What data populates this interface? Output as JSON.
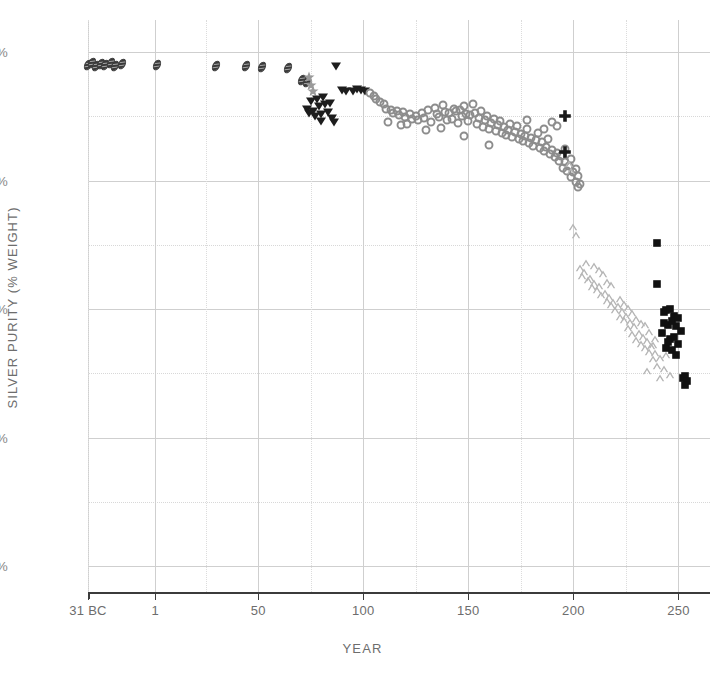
{
  "chart_data": {
    "type": "scatter",
    "title": "",
    "xlabel": "YEAR",
    "ylabel": "SILVER PURITY (% WEIGHT)",
    "xlim": [
      -31,
      265
    ],
    "ylim": [
      0,
      104
    ],
    "grid": true,
    "legend_position": "none",
    "xticks": [
      {
        "value": -31,
        "label": "31 BC"
      },
      {
        "value": 1,
        "label": "1"
      },
      {
        "value": 50,
        "label": "50"
      },
      {
        "value": 100,
        "label": "100"
      },
      {
        "value": 150,
        "label": "150"
      },
      {
        "value": 200,
        "label": "200"
      },
      {
        "value": 250,
        "label": "250"
      }
    ],
    "yticks": [
      {
        "value": 0,
        "label": "0%"
      },
      {
        "value": 25,
        "label": "25%"
      },
      {
        "value": 50,
        "label": "50%"
      },
      {
        "value": 75,
        "label": "75%"
      },
      {
        "value": 100,
        "label": "100%"
      }
    ],
    "y_minor_gridlines": [
      12.5,
      37.5,
      62.5,
      87.5
    ],
    "x_minor_gridlines": [
      -31,
      25,
      75,
      125,
      175,
      225
    ],
    "series": [
      {
        "name": "Republican / Augustan denarius",
        "marker": "hatched-ellipse",
        "color": "#3a3a3a",
        "points": [
          [
            -31,
            97.5
          ],
          [
            -29,
            97.8
          ],
          [
            -27,
            97.2
          ],
          [
            -25,
            97.6
          ],
          [
            -23,
            97.4
          ],
          [
            -20,
            97.9
          ],
          [
            -18,
            97.3
          ],
          [
            -15,
            97.6
          ],
          [
            2,
            97.4
          ],
          [
            30,
            97.3
          ],
          [
            44,
            97.2
          ],
          [
            52,
            97.1
          ],
          [
            64,
            96.8
          ],
          [
            71,
            94.6
          ],
          [
            73,
            94.2
          ]
        ]
      },
      {
        "name": "Tiberius–Nero group",
        "marker": "star",
        "color": "#9a9a9a",
        "points": [
          [
            74,
            95.2
          ],
          [
            75,
            93.6
          ],
          [
            76,
            92.4
          ]
        ]
      },
      {
        "name": "Flavian denarius",
        "marker": "triangle-down",
        "color": "#1d1d1d",
        "points": [
          [
            73,
            89.0
          ],
          [
            74,
            88.2
          ],
          [
            75,
            90.4
          ],
          [
            76,
            88.6
          ],
          [
            77,
            87.6
          ],
          [
            78,
            90.8
          ],
          [
            79,
            89.4
          ],
          [
            80,
            88.0
          ],
          [
            80,
            86.6
          ],
          [
            81,
            91.2
          ],
          [
            82,
            89.8
          ],
          [
            83,
            88.4
          ],
          [
            84,
            90.0
          ],
          [
            85,
            87.2
          ],
          [
            86,
            86.4
          ],
          [
            87,
            97.2
          ],
          [
            90,
            92.6
          ],
          [
            92,
            92.4
          ],
          [
            95,
            92.5
          ],
          [
            97,
            92.8
          ],
          [
            99,
            92.6
          ],
          [
            101,
            92.4
          ]
        ]
      },
      {
        "name": "2nd-century denarius (main series)",
        "marker": "circle-open",
        "color": "#8c8c8c",
        "points": [
          [
            103,
            92.0
          ],
          [
            105,
            91.4
          ],
          [
            106,
            90.8
          ],
          [
            108,
            90.2
          ],
          [
            110,
            89.8
          ],
          [
            111,
            89.0
          ],
          [
            113,
            88.8
          ],
          [
            114,
            88.2
          ],
          [
            116,
            88.6
          ],
          [
            117,
            87.8
          ],
          [
            119,
            88.4
          ],
          [
            120,
            87.4
          ],
          [
            122,
            88.0
          ],
          [
            123,
            87.0
          ],
          [
            125,
            87.6
          ],
          [
            126,
            86.8
          ],
          [
            128,
            88.2
          ],
          [
            129,
            87.2
          ],
          [
            131,
            88.8
          ],
          [
            132,
            86.4
          ],
          [
            134,
            89.2
          ],
          [
            135,
            88.0
          ],
          [
            136,
            87.4
          ],
          [
            138,
            89.6
          ],
          [
            139,
            88.4
          ],
          [
            140,
            86.8
          ],
          [
            141,
            88.2
          ],
          [
            142,
            87.0
          ],
          [
            143,
            89.0
          ],
          [
            144,
            88.6
          ],
          [
            145,
            86.2
          ],
          [
            146,
            88.8
          ],
          [
            147,
            87.6
          ],
          [
            148,
            89.4
          ],
          [
            149,
            88.0
          ],
          [
            150,
            86.6
          ],
          [
            151,
            87.8
          ],
          [
            152,
            89.8
          ],
          [
            153,
            88.2
          ],
          [
            154,
            86.0
          ],
          [
            155,
            87.2
          ],
          [
            156,
            88.6
          ],
          [
            157,
            85.4
          ],
          [
            158,
            86.8
          ],
          [
            159,
            87.6
          ],
          [
            160,
            85.0
          ],
          [
            161,
            86.2
          ],
          [
            162,
            87.0
          ],
          [
            163,
            84.6
          ],
          [
            164,
            85.8
          ],
          [
            165,
            86.6
          ],
          [
            166,
            84.2
          ],
          [
            167,
            85.4
          ],
          [
            168,
            83.8
          ],
          [
            169,
            84.8
          ],
          [
            170,
            86.0
          ],
          [
            171,
            83.4
          ],
          [
            172,
            84.4
          ],
          [
            173,
            85.6
          ],
          [
            174,
            83.0
          ],
          [
            175,
            84.0
          ],
          [
            176,
            82.6
          ],
          [
            177,
            83.6
          ],
          [
            178,
            85.0
          ],
          [
            179,
            82.2
          ],
          [
            180,
            83.2
          ],
          [
            181,
            81.8
          ],
          [
            182,
            82.8
          ],
          [
            183,
            84.2
          ],
          [
            184,
            81.4
          ],
          [
            185,
            82.4
          ],
          [
            186,
            80.8
          ],
          [
            187,
            81.6
          ],
          [
            188,
            83.0
          ],
          [
            189,
            80.2
          ],
          [
            190,
            81.0
          ],
          [
            191,
            79.6
          ],
          [
            192,
            80.4
          ],
          [
            193,
            78.8
          ],
          [
            194,
            79.8
          ],
          [
            195,
            77.4
          ],
          [
            196,
            78.6
          ],
          [
            197,
            76.8
          ],
          [
            198,
            77.8
          ],
          [
            199,
            75.6
          ],
          [
            200,
            76.6
          ],
          [
            201,
            74.8
          ],
          [
            202,
            75.8
          ],
          [
            148,
            83.6
          ],
          [
            160,
            82.0
          ],
          [
            137,
            85.2
          ],
          [
            118,
            85.8
          ],
          [
            130,
            84.8
          ],
          [
            121,
            86.0
          ],
          [
            112,
            86.4
          ],
          [
            192,
            85.6
          ],
          [
            190,
            86.4
          ],
          [
            186,
            85.0
          ],
          [
            178,
            86.8
          ],
          [
            196,
            81.2
          ],
          [
            199,
            79.2
          ],
          [
            201,
            77.2
          ],
          [
            202,
            73.8
          ],
          [
            203,
            74.4
          ]
        ]
      },
      {
        "name": "Septimius Severus high-purity issues",
        "marker": "plus",
        "color": "#1a1a1a",
        "points": [
          [
            196,
            87.6
          ],
          [
            196,
            80.6
          ]
        ]
      },
      {
        "name": "3rd-century antoninianus / debased denarius",
        "marker": "caret",
        "color": "#b5b5b5",
        "points": [
          [
            198,
            78.2
          ],
          [
            199,
            76.8
          ],
          [
            200,
            66.0
          ],
          [
            201,
            64.4
          ],
          [
            203,
            58.0
          ],
          [
            204,
            56.4
          ],
          [
            205,
            57.2
          ],
          [
            207,
            55.6
          ],
          [
            208,
            56.0
          ],
          [
            209,
            54.2
          ],
          [
            210,
            55.0
          ],
          [
            211,
            53.6
          ],
          [
            212,
            54.4
          ],
          [
            213,
            52.8
          ],
          [
            214,
            56.8
          ],
          [
            215,
            53.2
          ],
          [
            216,
            51.6
          ],
          [
            217,
            52.4
          ],
          [
            218,
            50.8
          ],
          [
            219,
            51.4
          ],
          [
            220,
            49.8
          ],
          [
            221,
            50.6
          ],
          [
            222,
            48.4
          ],
          [
            223,
            49.6
          ],
          [
            224,
            47.8
          ],
          [
            225,
            48.6
          ],
          [
            226,
            46.4
          ],
          [
            227,
            47.4
          ],
          [
            228,
            45.2
          ],
          [
            229,
            46.6
          ],
          [
            230,
            44.0
          ],
          [
            231,
            45.4
          ],
          [
            232,
            43.2
          ],
          [
            233,
            44.6
          ],
          [
            234,
            42.4
          ],
          [
            235,
            43.8
          ],
          [
            236,
            41.6
          ],
          [
            237,
            42.8
          ],
          [
            238,
            40.2
          ],
          [
            239,
            41.4
          ],
          [
            240,
            39.0
          ],
          [
            241,
            40.4
          ],
          [
            243,
            38.4
          ],
          [
            246,
            37.2
          ],
          [
            206,
            59.0
          ],
          [
            212,
            57.6
          ],
          [
            218,
            54.6
          ],
          [
            224,
            51.0
          ],
          [
            230,
            48.0
          ],
          [
            236,
            45.6
          ],
          [
            228,
            49.2
          ],
          [
            234,
            46.8
          ],
          [
            239,
            44.2
          ],
          [
            222,
            52.0
          ],
          [
            216,
            55.2
          ],
          [
            210,
            58.4
          ],
          [
            226,
            50.2
          ],
          [
            232,
            47.2
          ],
          [
            238,
            43.0
          ],
          [
            244,
            41.0
          ],
          [
            241,
            36.6
          ],
          [
            235,
            38.0
          ]
        ]
      },
      {
        "name": "Mid-3rd-century antoninianus",
        "marker": "square-filled",
        "color": "#111111",
        "points": [
          [
            240,
            62.8
          ],
          [
            240,
            54.8
          ],
          [
            243,
            49.4
          ],
          [
            244,
            49.8
          ],
          [
            246,
            50.0
          ],
          [
            243,
            47.2
          ],
          [
            245,
            46.8
          ],
          [
            248,
            48.6
          ],
          [
            242,
            45.4
          ],
          [
            246,
            44.2
          ],
          [
            248,
            44.6
          ],
          [
            249,
            46.6
          ],
          [
            244,
            42.4
          ],
          [
            247,
            42.0
          ],
          [
            250,
            43.2
          ],
          [
            249,
            41.0
          ],
          [
            251,
            45.8
          ],
          [
            252,
            36.6
          ],
          [
            253,
            37.0
          ],
          [
            254,
            36.0
          ],
          [
            253,
            35.2
          ],
          [
            247,
            47.6
          ],
          [
            250,
            48.2
          ],
          [
            245,
            43.6
          ]
        ]
      }
    ]
  },
  "axis_style": {
    "grid_major_color": "#cfcfcf",
    "grid_minor_color": "#dcdcdc",
    "axis_color": "#3b3b3b",
    "tick_label_color": "#7d7d7d"
  }
}
